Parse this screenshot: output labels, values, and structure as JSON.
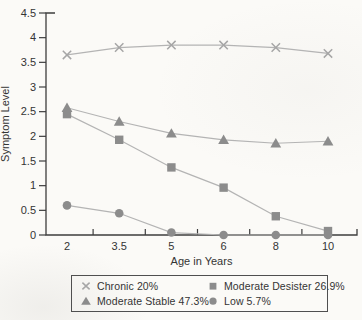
{
  "figure": {
    "bg": "#fbfaf7",
    "axis_color": "#3e3e3e",
    "text_color": "#343434",
    "line_color": "#b4b4b4",
    "cross_color": "#a6a6a6",
    "marker_color": "#8c8c8c",
    "legend_border_color": "#4f4f4f"
  },
  "chart_data": {
    "type": "line",
    "title": "",
    "xlabel": "Age in Years",
    "ylabel": "Symptom Level",
    "categories": [
      "2",
      "3.5",
      "5",
      "6",
      "8",
      "10"
    ],
    "ylim": [
      0,
      4.5
    ],
    "grid": false,
    "legend_position": "bottom-box-two-column",
    "yticks": [
      {
        "value": 4.5,
        "label": "4.5"
      },
      {
        "value": 4,
        "label": "4"
      },
      {
        "value": 3.5,
        "label": "3.5"
      },
      {
        "value": 3,
        "label": "3"
      },
      {
        "value": 2.5,
        "label": "2.5"
      },
      {
        "value": 2,
        "label": "2"
      },
      {
        "value": 1.5,
        "label": "1.5"
      },
      {
        "value": 1,
        "label": "1"
      },
      {
        "value": 0.5,
        "label": "0.5"
      },
      {
        "value": 0,
        "label": "0"
      }
    ],
    "series": [
      {
        "name": "Chronic 20%",
        "marker": "cross",
        "values": [
          3.65,
          3.8,
          3.85,
          3.85,
          3.8,
          3.68
        ]
      },
      {
        "name": "Moderate Desister 26.9%",
        "marker": "square",
        "values": [
          2.45,
          1.93,
          1.37,
          0.96,
          0.38,
          0.08
        ]
      },
      {
        "name": "Moderate Stable 47.3%",
        "marker": "triangle",
        "values": [
          2.58,
          2.3,
          2.06,
          1.93,
          1.86,
          1.9
        ]
      },
      {
        "name": "Low 5.7%",
        "marker": "circle",
        "values": [
          0.6,
          0.44,
          0.05,
          0.0,
          0.0,
          0.0
        ]
      }
    ]
  }
}
